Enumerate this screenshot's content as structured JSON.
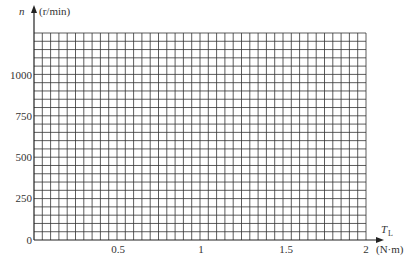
{
  "chart_data": {
    "type": "line",
    "title": "",
    "xlabel": "T_L",
    "xunit": "(N·m)",
    "ylabel": "n",
    "yunit": "(r/min)",
    "xlim": [
      0,
      2
    ],
    "ylim": [
      0,
      1250
    ],
    "x_ticks": [
      "0.5",
      "1",
      "1.5",
      "2"
    ],
    "y_ticks": [
      "0",
      "250",
      "500",
      "750",
      "1000"
    ],
    "grid": true,
    "grid_x_step": 0.05,
    "grid_y_step": 50,
    "series": []
  },
  "labels": {
    "y_axis_symbol": "n",
    "y_axis_unit": "(r/min)",
    "x_axis_symbol": "T",
    "x_axis_subscript": "L",
    "x_axis_unit": "(N·m)",
    "origin": "0",
    "y_1000": "1000",
    "y_750": "750",
    "y_500": "500",
    "y_250": "250",
    "x_05": "0.5",
    "x_1": "1",
    "x_15": "1.5",
    "x_2": "2"
  }
}
